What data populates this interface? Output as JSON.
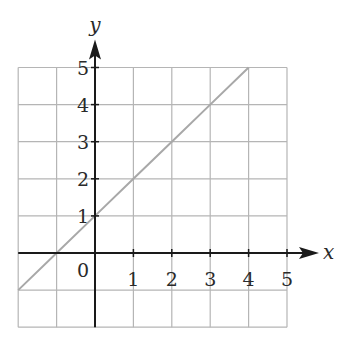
{
  "chart_data": {
    "type": "line",
    "title": "",
    "xlabel": "x",
    "ylabel": "y",
    "xlim": [
      -2,
      5
    ],
    "ylim": [
      -2,
      5
    ],
    "grid": true,
    "x_ticks": [
      "1",
      "2",
      "3",
      "4",
      "5"
    ],
    "y_ticks": [
      "1",
      "2",
      "3",
      "4",
      "5"
    ],
    "origin_label": "0",
    "series": [
      {
        "name": "y = x + 1",
        "x": [
          -2,
          -1,
          0,
          1,
          2,
          3,
          4
        ],
        "y": [
          -1,
          0,
          1,
          2,
          3,
          4,
          5
        ],
        "color": "#a8a8a8"
      }
    ]
  },
  "colors": {
    "grid": "#b5b5b5",
    "axis": "#1a1a1a",
    "line": "#a8a8a8",
    "text": "#2a2a2a"
  }
}
